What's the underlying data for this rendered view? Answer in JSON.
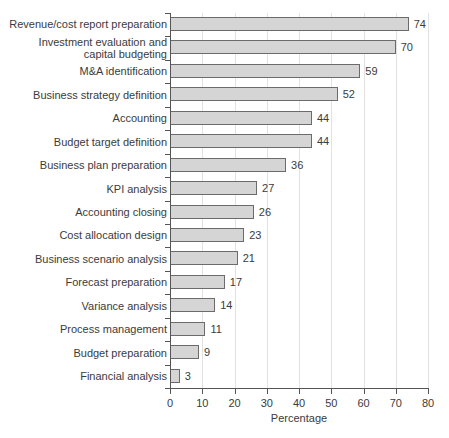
{
  "chart_data": {
    "type": "bar",
    "orientation": "horizontal",
    "title": "",
    "xlabel": "Percentage",
    "ylabel": "",
    "xlim": [
      0,
      80
    ],
    "xticks": [
      0,
      10,
      20,
      30,
      40,
      50,
      60,
      70,
      80
    ],
    "grid": "vertical",
    "legend": "none",
    "categories": [
      "Revenue/cost report preparation",
      "Investment evaluation and\ncapital budgeting",
      "M&A identification",
      "Business strategy definition",
      "Accounting",
      "Budget target definition",
      "Business plan preparation",
      "KPI analysis",
      "Accounting closing",
      "Cost allocation design",
      "Business scenario analysis",
      "Forecast preparation",
      "Variance analysis",
      "Process management",
      "Budget preparation",
      "Financial analysis"
    ],
    "values": [
      74,
      70,
      59,
      52,
      44,
      44,
      36,
      27,
      26,
      23,
      21,
      17,
      14,
      11,
      9,
      3
    ],
    "value_labels": [
      "74",
      "70",
      "59",
      "52",
      "44",
      "44",
      "36",
      "27",
      "26",
      "23",
      "21",
      "17",
      "14",
      "11",
      "9",
      "3"
    ],
    "colors": {
      "bar_fill": "#d5d5d5",
      "bar_border": "#6b6b6b",
      "gridline": "#e2e2e2",
      "axis": "#555555",
      "text": "#3b3b3b",
      "background": "#ffffff"
    }
  }
}
